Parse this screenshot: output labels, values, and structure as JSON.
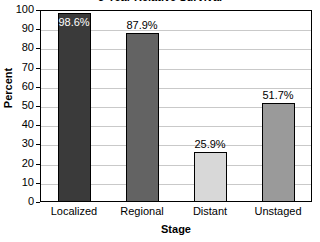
{
  "chart_data": {
    "type": "bar",
    "title": "5-Year Relative Survival",
    "xlabel": "Stage",
    "ylabel": "Percent",
    "categories": [
      "Localized",
      "Regional",
      "Distant",
      "Unstaged"
    ],
    "values": [
      98.6,
      87.9,
      25.9,
      51.7
    ],
    "value_labels": [
      "98.6%",
      "87.9%",
      "25.9%",
      "51.7%"
    ],
    "bar_colors": [
      "#3a3a3a",
      "#636363",
      "#d8d8d8",
      "#9a9a9a"
    ],
    "label_placement": [
      "inside",
      "above",
      "above",
      "above"
    ],
    "ylim": [
      0,
      100
    ],
    "yticks": [
      0,
      10,
      20,
      30,
      40,
      50,
      60,
      70,
      80,
      90,
      100
    ],
    "ytick_labels": [
      "0",
      "10",
      "20",
      "30",
      "40",
      "50",
      "60",
      "70",
      "80",
      "90",
      "100"
    ],
    "grid": true,
    "legend": false
  }
}
